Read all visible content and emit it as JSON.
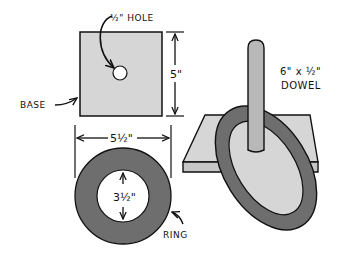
{
  "diagram": {
    "type": "ring-toss game plan",
    "colors": {
      "base_fill": "#d6d6d6",
      "ring_fill": "#6e6e6e",
      "dowel_fill": "#b8b8b8",
      "line": "#111111",
      "background": "#ffffff"
    },
    "labels": {
      "hole": "½\" HOLE",
      "base": "BASE",
      "base_height": "5\"",
      "ring_outer": "5½\"",
      "ring_inner": "3½\"",
      "ring": "RING",
      "dowel_size": "6\" x ½\"",
      "dowel": "DOWEL"
    },
    "parts": [
      {
        "name": "Base",
        "shape": "square",
        "size": "5\"",
        "feature": "½\" hole"
      },
      {
        "name": "Ring",
        "outer_diameter": "5½\"",
        "inner_diameter": "3½\""
      },
      {
        "name": "Dowel",
        "size": "6\" x ½\""
      }
    ]
  }
}
